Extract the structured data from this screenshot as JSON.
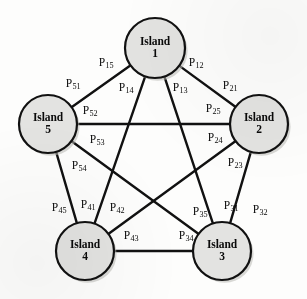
{
  "figure": {
    "type": "network-diagram",
    "background_color": "#fdfdfc",
    "node_fill_color": "#e3e3e1",
    "node_stroke_color": "#111111",
    "edge_color": "#111111"
  },
  "nodes": [
    {
      "id": "n1",
      "name": "Island",
      "number": "1",
      "cx": 155,
      "cy": 48,
      "r": 30
    },
    {
      "id": "n2",
      "name": "Island",
      "number": "2",
      "cx": 259,
      "cy": 124,
      "r": 29
    },
    {
      "id": "n3",
      "name": "Island",
      "number": "3",
      "cx": 222,
      "cy": 251,
      "r": 29
    },
    {
      "id": "n4",
      "name": "Island",
      "number": "4",
      "cx": 85,
      "cy": 251,
      "r": 29
    },
    {
      "id": "n5",
      "name": "Island",
      "number": "5",
      "cx": 48,
      "cy": 124,
      "r": 29
    }
  ],
  "edges": [
    {
      "id": "e12",
      "from": "n1",
      "to": "n2"
    },
    {
      "id": "e13",
      "from": "n1",
      "to": "n3"
    },
    {
      "id": "e14",
      "from": "n1",
      "to": "n4"
    },
    {
      "id": "e15",
      "from": "n1",
      "to": "n5"
    },
    {
      "id": "e23",
      "from": "n2",
      "to": "n3"
    },
    {
      "id": "e24",
      "from": "n2",
      "to": "n4"
    },
    {
      "id": "e25",
      "from": "n2",
      "to": "n5"
    },
    {
      "id": "e34",
      "from": "n3",
      "to": "n4"
    },
    {
      "id": "e35",
      "from": "n3",
      "to": "n5"
    },
    {
      "id": "e45",
      "from": "n4",
      "to": "n5"
    }
  ],
  "edge_labels": [
    {
      "id": "P15",
      "base": "P",
      "sub": "15",
      "x": 106,
      "y": 62
    },
    {
      "id": "P12",
      "base": "P",
      "sub": "12",
      "x": 196,
      "y": 62
    },
    {
      "id": "P14",
      "base": "P",
      "sub": "14",
      "x": 126,
      "y": 87
    },
    {
      "id": "P13",
      "base": "P",
      "sub": "13",
      "x": 180,
      "y": 87
    },
    {
      "id": "P51",
      "base": "P",
      "sub": "51",
      "x": 73,
      "y": 83
    },
    {
      "id": "P21",
      "base": "P",
      "sub": "21",
      "x": 230,
      "y": 85
    },
    {
      "id": "P52",
      "base": "P",
      "sub": "52",
      "x": 90,
      "y": 110
    },
    {
      "id": "P25",
      "base": "P",
      "sub": "25",
      "x": 213,
      "y": 108
    },
    {
      "id": "P53",
      "base": "P",
      "sub": "53",
      "x": 97,
      "y": 139
    },
    {
      "id": "P24",
      "base": "P",
      "sub": "24",
      "x": 215,
      "y": 137
    },
    {
      "id": "P54",
      "base": "P",
      "sub": "54",
      "x": 79,
      "y": 165
    },
    {
      "id": "P23",
      "base": "P",
      "sub": "23",
      "x": 235,
      "y": 162
    },
    {
      "id": "P45",
      "base": "P",
      "sub": "45",
      "x": 59,
      "y": 207
    },
    {
      "id": "P41",
      "base": "P",
      "sub": "41",
      "x": 88,
      "y": 204
    },
    {
      "id": "P42",
      "base": "P",
      "sub": "42",
      "x": 117,
      "y": 207
    },
    {
      "id": "P35",
      "base": "P",
      "sub": "35",
      "x": 200,
      "y": 211
    },
    {
      "id": "P31",
      "base": "P",
      "sub": "31",
      "x": 231,
      "y": 205
    },
    {
      "id": "P32",
      "base": "P",
      "sub": "32",
      "x": 260,
      "y": 209
    },
    {
      "id": "P43",
      "base": "P",
      "sub": "43",
      "x": 131,
      "y": 235
    },
    {
      "id": "P34",
      "base": "P",
      "sub": "34",
      "x": 186,
      "y": 235
    }
  ]
}
